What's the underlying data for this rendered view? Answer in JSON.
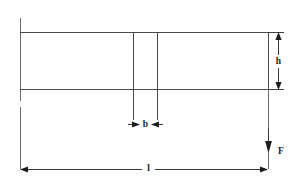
{
  "figure": {
    "background_color": "#ffffff",
    "line_color": "#4a4a4a",
    "label_color": "#1c1c1c",
    "width": 303,
    "height": 188
  },
  "labels": {
    "height": "h",
    "notch_width": "b",
    "length": "l",
    "force": "F"
  },
  "geometry": {
    "beam": {
      "left": 20,
      "right": 268,
      "top": 32,
      "bottom": 89
    },
    "notch": {
      "left_x": 133,
      "right_x": 157,
      "top_y": 32,
      "bottom_y": 120
    },
    "left_extension": {
      "x": 20,
      "top": 18,
      "bottom": 169
    },
    "right_extension": {
      "x": 268,
      "top": 32,
      "bottom": 169
    }
  },
  "dimensions": {
    "h": {
      "axis_x": 278,
      "from_y": 32,
      "to_y": 89,
      "label_y": 61,
      "arrow_direction": "both",
      "tick_extent": 10
    },
    "b": {
      "axis_y": 124,
      "from_x": 133,
      "to_x": 157,
      "label_x": 145,
      "arrow_direction": "inward"
    },
    "l": {
      "axis_y": 169,
      "from_x": 20,
      "to_x": 268,
      "label_x": 148,
      "arrow_direction": "outward"
    },
    "force": {
      "x": 268,
      "tail_y": 128,
      "head_y": 152,
      "label_x": 280,
      "label_y": 152,
      "direction": "down"
    }
  }
}
